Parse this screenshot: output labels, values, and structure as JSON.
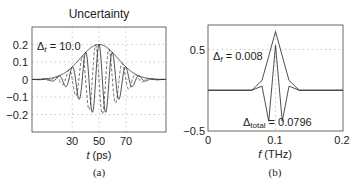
{
  "chart_data": [
    {
      "type": "line",
      "panel": "(a)",
      "title": "Uncertainty",
      "xlabel": "t (ps)",
      "ylabel": "",
      "xlim": [
        0,
        100
      ],
      "ylim": [
        -0.3,
        0.3
      ],
      "xticks": [
        30,
        50,
        70
      ],
      "yticks": [
        0.2,
        0.1,
        0,
        -0.1,
        -0.2
      ],
      "ytick_labels": [
        "0.2",
        "0.1",
        "0",
        "−0.1",
        "−0.2"
      ],
      "grid": true,
      "annotation": "Δt = 10.0",
      "series": [
        {
          "name": "envelope",
          "style": "solid",
          "description": "Gaussian envelope, peak 0.2 at t=50"
        },
        {
          "name": "real part",
          "style": "solid",
          "description": "Gaussian-modulated cosine, period ~10 ps, min ~-0.18"
        },
        {
          "name": "imaginary part",
          "style": "dashed",
          "description": "Gaussian-modulated sine (quadrature)"
        }
      ],
      "params": {
        "center": 50,
        "amplitude": 0.2,
        "sigma": 14,
        "period": 10
      }
    },
    {
      "type": "line",
      "panel": "(b)",
      "title": "",
      "xlabel": "f (THz)",
      "ylabel": "",
      "xlim": [
        0,
        0.2
      ],
      "ylim": [
        -0.5,
        0.8
      ],
      "xticks": [
        0,
        0.1,
        0.2
      ],
      "xtick_labels": [
        "0",
        "0.1",
        "0.2"
      ],
      "yticks": [
        0.5,
        -0.5
      ],
      "ytick_labels": [
        "0.5",
        "−0.5"
      ],
      "grid": true,
      "annotations": [
        "Δf = 0.008",
        "Δtotal = 0.0796"
      ],
      "series": [
        {
          "name": "magnitude spectrum",
          "style": "solid",
          "x": [
            0,
            0.065,
            0.08,
            0.1,
            0.12,
            0.135,
            0.2
          ],
          "values": [
            0,
            0,
            0.12,
            0.72,
            0.12,
            0,
            0
          ]
        },
        {
          "name": "real spectrum",
          "style": "solid",
          "x": [
            0,
            0.065,
            0.08,
            0.09,
            0.1,
            0.11,
            0.12,
            0.135,
            0.2
          ],
          "values": [
            0,
            0,
            0.05,
            -0.38,
            0.55,
            -0.38,
            0.05,
            0,
            0
          ]
        }
      ]
    }
  ],
  "panel_a": {
    "title": "Uncertainty",
    "annotation": "Δ",
    "annotation_sub": "t",
    "annotation_val": " = 10.0",
    "xticks": [
      "30",
      "50",
      "70"
    ],
    "yticks": [
      "0.2",
      "0.1",
      "0",
      "−0.1",
      "−0.2"
    ],
    "xlabel_var": "t",
    "xlabel_unit": " (ps)",
    "caption": "(a)"
  },
  "panel_b": {
    "annotation_f": "Δ",
    "annotation_f_sub": "f",
    "annotation_f_val": " = 0.008",
    "annotation_total": "Δ",
    "annotation_total_sub": "total",
    "annotation_total_val": " = 0.0796",
    "xticks": [
      "0",
      "0.1",
      "0.2"
    ],
    "yticks": [
      "0.5",
      "−0.5"
    ],
    "xlabel_var": "f",
    "xlabel_unit": " (THz)",
    "caption": "(b)"
  }
}
